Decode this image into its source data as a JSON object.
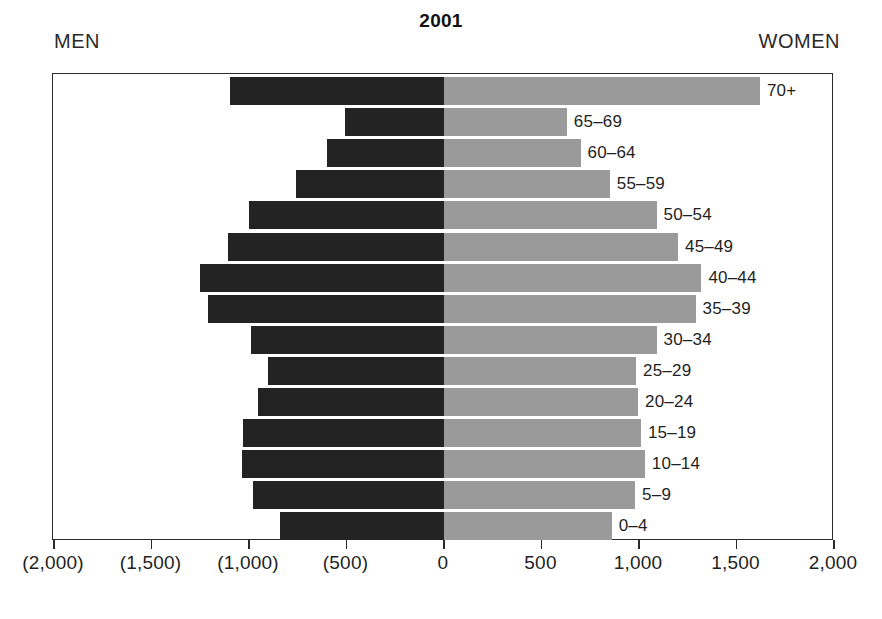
{
  "chart_data": {
    "type": "bar",
    "subtype": "population-pyramid",
    "title": "2001",
    "xlabel": "",
    "ylabel": "",
    "xlim": [
      -2000,
      2000
    ],
    "grid": false,
    "legend_position": "top-outside",
    "left_group_label": "MEN",
    "right_group_label": "WOMEN",
    "categories": [
      "70+",
      "65–69",
      "60–64",
      "55–59",
      "50–54",
      "45–49",
      "40–44",
      "35–39",
      "30–34",
      "25–29",
      "20–24",
      "15–19",
      "10–14",
      "5–9",
      "0–4"
    ],
    "series": [
      {
        "name": "MEN",
        "color": "#232323",
        "side": "left",
        "values": [
          1100,
          510,
          600,
          760,
          1000,
          1110,
          1250,
          1210,
          990,
          905,
          955,
          1030,
          1035,
          980,
          840
        ]
      },
      {
        "name": "WOMEN",
        "color": "#9a9a9a",
        "side": "right",
        "values": [
          1620,
          630,
          700,
          850,
          1090,
          1200,
          1320,
          1290,
          1090,
          985,
          995,
          1010,
          1030,
          980,
          860
        ]
      }
    ],
    "xticks": [
      -2000,
      -1500,
      -1000,
      -500,
      0,
      500,
      1000,
      1500,
      2000
    ],
    "xtick_labels": [
      "(2,000)",
      "(1,500)",
      "(1,000)",
      "(500)",
      "0",
      "500",
      "1,000",
      "1,500",
      "2,000"
    ]
  }
}
